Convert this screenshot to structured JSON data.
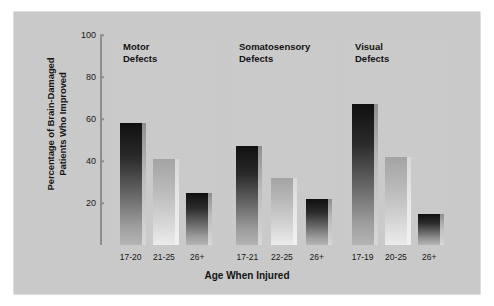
{
  "chart_data": {
    "type": "bar",
    "title": "",
    "xlabel": "Age When Injured",
    "ylabel_line1": "Percentage of Brain-Damaged",
    "ylabel_line2": "Patients Who Improved",
    "ylim": [
      0,
      100
    ],
    "yticks": [
      20,
      40,
      60,
      80,
      100
    ],
    "grid": false,
    "legend": "none",
    "groups": [
      {
        "name": "Motor\nDefects",
        "categories": [
          "17-20",
          "21-25",
          "26+"
        ],
        "values": [
          58,
          41,
          25
        ],
        "shades": [
          "dark",
          "light",
          "dark"
        ]
      },
      {
        "name": "Somatosensory\nDefects",
        "categories": [
          "17-21",
          "22-25",
          "26+"
        ],
        "values": [
          47,
          32,
          22
        ],
        "shades": [
          "dark",
          "light",
          "dark"
        ]
      },
      {
        "name": "Visual\nDefects",
        "categories": [
          "17-19",
          "20-25",
          "26+"
        ],
        "values": [
          67,
          42,
          15
        ],
        "shades": [
          "dark",
          "light",
          "dark"
        ]
      }
    ]
  },
  "colors": {
    "panel_background": "#c9c9c9",
    "group_background": "#cacaca",
    "axis": "#8d8d8d",
    "text": "#131313",
    "bar_dark_top": "#101010",
    "bar_light_top": "#a4a4a4"
  }
}
